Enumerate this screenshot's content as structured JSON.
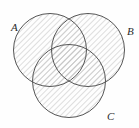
{
  "figure": {
    "kind": "venn-diagram",
    "width": 139,
    "height": 128,
    "background_color": "#fefefe",
    "stroke_color": "#555555",
    "stroke_width": 1,
    "hatch_color": "#bdbdbd",
    "hatch_angle_deg": 45,
    "hatch_spacing_px": 4,
    "all_regions_shaded": true
  },
  "sets": [
    {
      "id": "A",
      "label": "A",
      "cx": 50,
      "cy": 50,
      "r": 36.5,
      "label_x": 11,
      "label_y": 31,
      "shaded": true
    },
    {
      "id": "B",
      "label": "B",
      "cx": 88,
      "cy": 50,
      "r": 36.5,
      "label_x": 127,
      "label_y": 35,
      "shaded": true
    },
    {
      "id": "C",
      "label": "C",
      "cx": 69,
      "cy": 81,
      "r": 36.5,
      "label_x": 107,
      "label_y": 120,
      "shaded": true
    }
  ]
}
